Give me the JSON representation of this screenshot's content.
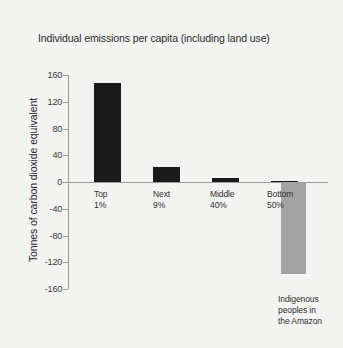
{
  "chart_data": {
    "type": "bar",
    "title": "Individual emissions per capita (including land use)",
    "xlabel": "",
    "ylabel": "Tonnes of carbon dioxide equivalent",
    "ylim": [
      -160,
      160
    ],
    "yticks": [
      160,
      120,
      80,
      40,
      0,
      -40,
      -80,
      -120,
      -160
    ],
    "ytick_labels": [
      "160",
      "120",
      "80",
      "40",
      "0",
      "-40",
      "-80",
      "-120",
      "-160"
    ],
    "grid": false,
    "legend": "none",
    "categories": [
      "Top 1%",
      "Next 9%",
      "Middle 40%",
      "Bottom 50%",
      "Indigenous peoples in the Amazon"
    ],
    "category_lines": [
      [
        "Top",
        "1%"
      ],
      [
        "Next",
        "9%"
      ],
      [
        "Middle",
        "40%"
      ],
      [
        "Bottom",
        "50%"
      ],
      [
        "Indigenous",
        "peoples in",
        "the Amazon"
      ]
    ],
    "values": [
      148,
      22,
      6,
      1,
      -137
    ],
    "bar_colors": [
      "#1a1a1a",
      "#1a1a1a",
      "#1a1a1a",
      "#1a1a1a",
      "#a3a3a3"
    ]
  },
  "colors": {
    "background": "#f3f3f1",
    "bar_dark": "#1a1a1a",
    "bar_grey": "#a3a3a3",
    "axis": "#9a9a98",
    "text": "#2b2b2b"
  }
}
